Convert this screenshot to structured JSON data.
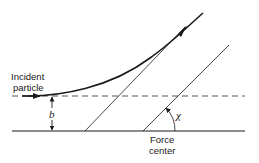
{
  "labels": {
    "incident_line1": "Incident",
    "incident_line2": "particle",
    "impact_parameter": "b",
    "scattering_angle": "χ",
    "force_center_line1": "Force",
    "force_center_line2": "center"
  },
  "colors": {
    "stroke": "#1a1a1a",
    "dashed": "#555555",
    "background": "#ffffff"
  }
}
